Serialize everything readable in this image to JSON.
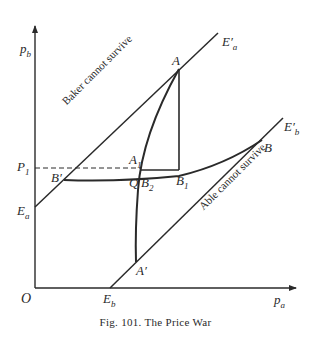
{
  "figure": {
    "caption": "Fig. 101.   The Price War"
  },
  "axes": {
    "y_label": "p",
    "y_label_sub": "b",
    "x_label": "p",
    "x_label_sub": "a",
    "origin_label": "O"
  },
  "points": {
    "A": "A",
    "A1": "A",
    "A1_sub": "1",
    "A_prime": "A′",
    "B": "B",
    "B_prime": "B′",
    "B1": "B",
    "B1_sub": "1",
    "B2": "B",
    "B2_sub": "2",
    "Q": "Q",
    "P1": "P",
    "P1_sub": "1",
    "Ea": "E",
    "Ea_sub": "a",
    "Eb": "E",
    "Eb_sub": "b",
    "Ea_prime": "E′",
    "Ea_prime_sub": "a",
    "Eb_prime": "E′",
    "Eb_prime_sub": "b"
  },
  "regions": {
    "baker": "Baker cannot survive",
    "able": "Able cannot survive"
  }
}
